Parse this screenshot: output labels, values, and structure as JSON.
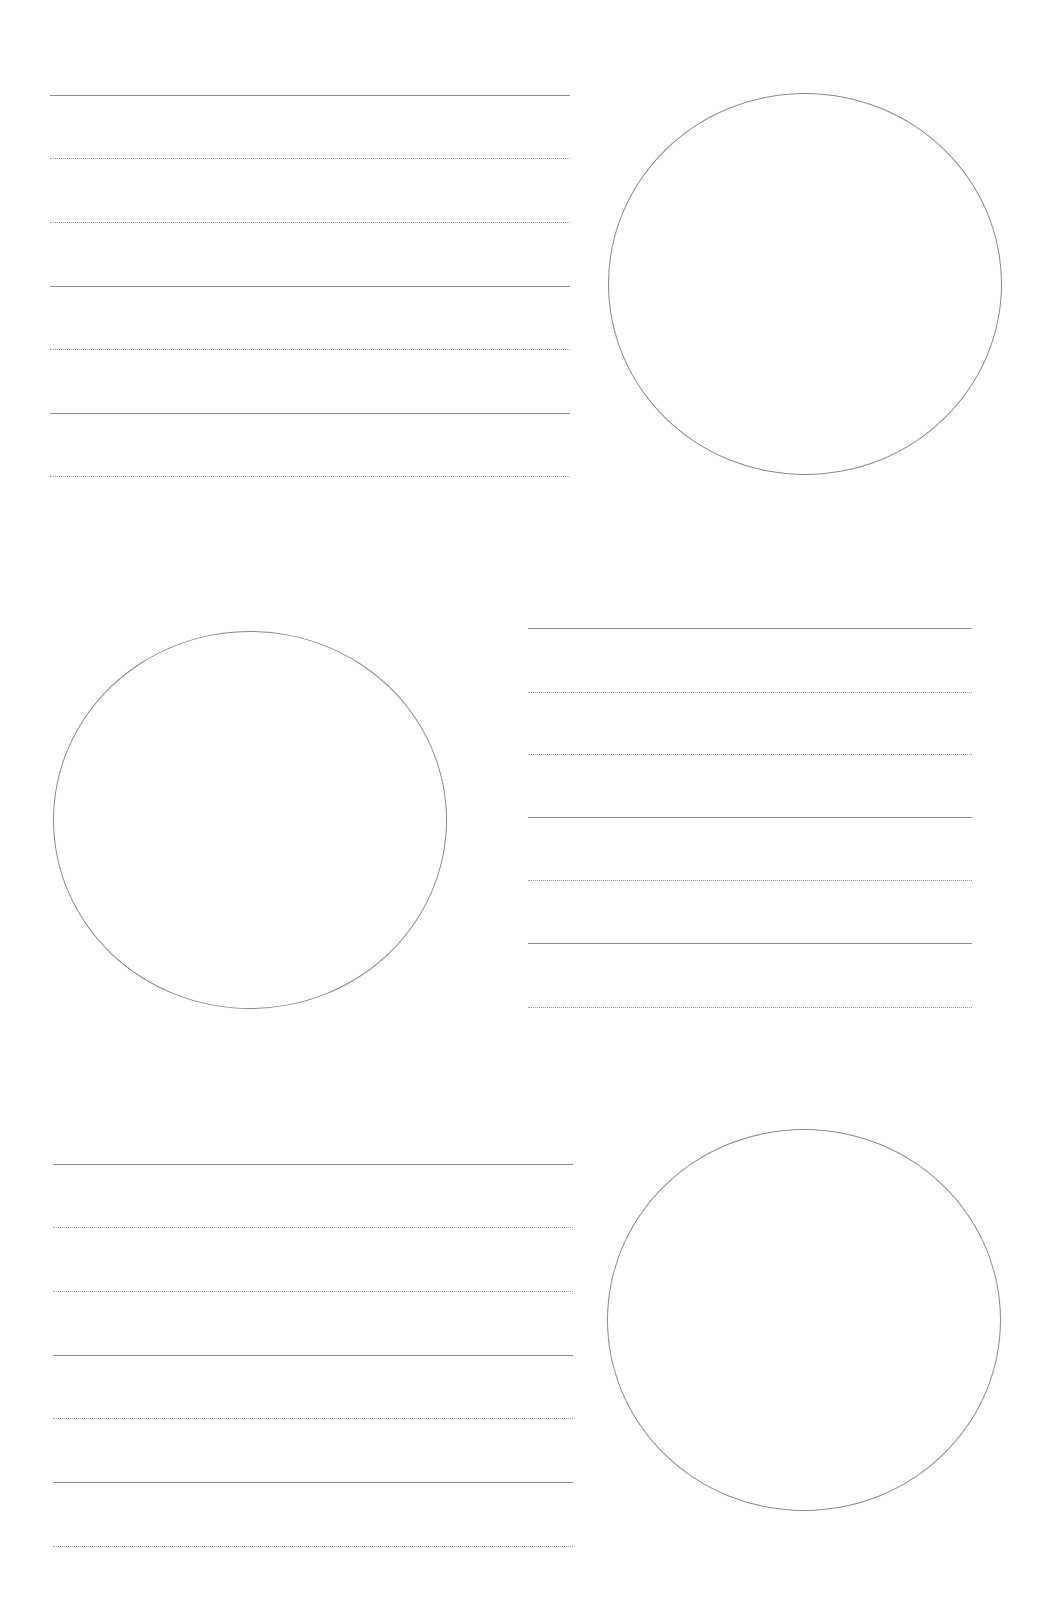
{
  "page": {
    "background": "#ffffff",
    "line_color": "#8c8c8c",
    "width": 1050,
    "height": 1602
  },
  "blocks": [
    {
      "name": "block-1",
      "lines": {
        "x1": 50,
        "x2": 570,
        "rules": [
          {
            "y": 95,
            "style": "solid"
          },
          {
            "y": 158,
            "style": "dotted"
          },
          {
            "y": 222,
            "style": "dotted"
          },
          {
            "y": 286,
            "style": "solid"
          },
          {
            "y": 349,
            "style": "dotted"
          },
          {
            "y": 413,
            "style": "solid"
          },
          {
            "y": 476,
            "style": "dotted"
          }
        ]
      },
      "circle": {
        "cx": 805,
        "cy": 284,
        "rx": 197,
        "ry": 191
      }
    },
    {
      "name": "block-2",
      "lines": {
        "x1": 528,
        "x2": 972,
        "rules": [
          {
            "y": 628,
            "style": "solid"
          },
          {
            "y": 692,
            "style": "dotted"
          },
          {
            "y": 754,
            "style": "dotted"
          },
          {
            "y": 817,
            "style": "solid"
          },
          {
            "y": 880,
            "style": "dotted"
          },
          {
            "y": 943,
            "style": "solid"
          },
          {
            "y": 1007,
            "style": "dotted"
          }
        ]
      },
      "circle": {
        "cx": 250,
        "cy": 820,
        "rx": 197,
        "ry": 189
      }
    },
    {
      "name": "block-3",
      "lines": {
        "x1": 53,
        "x2": 573,
        "rules": [
          {
            "y": 1164,
            "style": "solid"
          },
          {
            "y": 1227,
            "style": "dotted"
          },
          {
            "y": 1291,
            "style": "dotted"
          },
          {
            "y": 1355,
            "style": "solid"
          },
          {
            "y": 1418,
            "style": "dotted"
          },
          {
            "y": 1482,
            "style": "solid"
          },
          {
            "y": 1546,
            "style": "dotted"
          }
        ]
      },
      "circle": {
        "cx": 804,
        "cy": 1320,
        "rx": 197,
        "ry": 191
      }
    }
  ]
}
